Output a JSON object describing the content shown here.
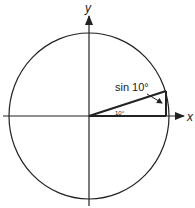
{
  "diagram": {
    "axes": {
      "x_label": "x",
      "y_label": "y"
    },
    "angle_label": "10°",
    "sine_label": "sin 10°",
    "angle_degrees": 10,
    "colors": {
      "stroke": "#222222",
      "background": "#ffffff"
    }
  }
}
